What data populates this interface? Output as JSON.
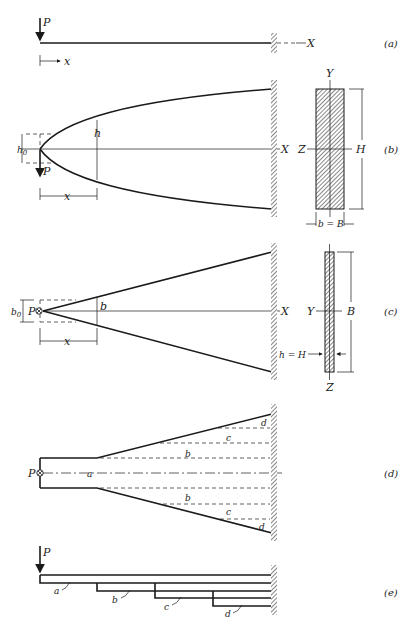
{
  "figure": {
    "panels": [
      {
        "id": "a",
        "label": "(a)",
        "description": "Cantilever beam with tip load",
        "labels": {
          "load": "P",
          "axis": "X",
          "coord": "x"
        }
      },
      {
        "id": "b",
        "label": "(b)",
        "description": "Parabolic depth profile beam, constant width",
        "labels": {
          "load": "P",
          "axis": "X",
          "tip_height": "h0",
          "height": "h",
          "coord": "x"
        },
        "section": {
          "top_axis": "Y",
          "side_axis": "Z",
          "height": "H",
          "width": "b = B"
        }
      },
      {
        "id": "c",
        "label": "(c)",
        "description": "Triangular width profile beam, constant depth",
        "labels": {
          "load": "P",
          "axis": "X",
          "tip_width": "b0",
          "width": "b",
          "coord": "x"
        },
        "section": {
          "side_axis": "Y",
          "bottom_axis": "Z",
          "width": "B",
          "height": "h = H"
        }
      },
      {
        "id": "d",
        "label": "(d)",
        "description": "Leaf spring plan view with leaves",
        "labels": {
          "load": "P",
          "leaves": [
            "a",
            "b",
            "c",
            "d",
            "b",
            "c",
            "d"
          ]
        }
      },
      {
        "id": "e",
        "label": "(e)",
        "description": "Leaf spring side view with stacked leaves",
        "labels": {
          "load": "P",
          "leaves": [
            "a",
            "b",
            "c",
            "d"
          ]
        }
      }
    ]
  }
}
